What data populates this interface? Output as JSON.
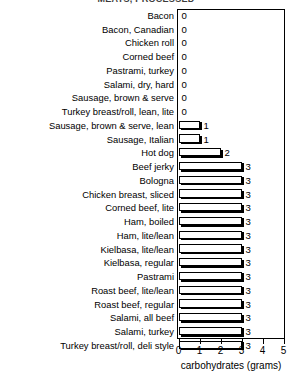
{
  "chart_data": {
    "type": "bar",
    "orientation": "horizontal",
    "title": "MEATS, PROCESSED",
    "xlabel": "carbohydrates (grams)",
    "ylabel": "",
    "xlim": [
      0,
      5
    ],
    "xticks": [
      "0",
      "1",
      "2",
      "3",
      "4",
      "5"
    ],
    "grid": false,
    "legend": null,
    "categories": [
      "Bacon",
      "Bacon, Canadian",
      "Chicken roll",
      "Corned beef",
      "Pastrami, turkey",
      "Salami, dry, hard",
      "Sausage, brown & serve",
      "Turkey breast/roll, lean, lite",
      "Sausage, brown & serve, lean",
      "Sausage, Italian",
      "Hot dog",
      "Beef jerky",
      "Bologna",
      "Chicken breast, sliced",
      "Corned beef, lite",
      "Ham, boiled",
      "Ham, lite/lean",
      "Kielbasa, lite/lean",
      "Kielbasa, regular",
      "Pastrami",
      "Roast beef, lite/lean",
      "Roast beef, regular",
      "Salami, all beef",
      "Salami, turkey",
      "Turkey breast/roll, deli style"
    ],
    "values": [
      0,
      0,
      0,
      0,
      0,
      0,
      0,
      0,
      1,
      1,
      2,
      3,
      3,
      3,
      3,
      3,
      3,
      3,
      3,
      3,
      3,
      3,
      3,
      3,
      3
    ],
    "value_labels": [
      "0",
      "0",
      "0",
      "0",
      "0",
      "0",
      "0",
      "0",
      "1",
      "1",
      "2",
      "3",
      "3",
      "3",
      "3",
      "3",
      "3",
      "3",
      "3",
      "3",
      "3",
      "3",
      "3",
      "3",
      "3"
    ]
  },
  "colors": {
    "bar_fill": "#ffffff",
    "bar_edge": "#000000",
    "bar_shadow": "#000000",
    "text": "#000000",
    "background": "#ffffff"
  }
}
